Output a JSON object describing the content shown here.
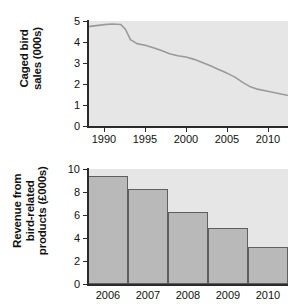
{
  "chart_data": [
    {
      "type": "line",
      "id": "caged-bird-sales",
      "title": "",
      "ylabel_lines": [
        "Caged bird",
        "sales (000s)"
      ],
      "xlabel": "",
      "xlim": [
        1988.0,
        2012.5
      ],
      "ylim": [
        0,
        5.2
      ],
      "yticks": [
        0,
        1,
        2,
        3,
        4,
        5
      ],
      "ytick_labels": [
        "0",
        "1",
        "2",
        "3",
        "4",
        "5"
      ],
      "xticks": [
        1990,
        1995,
        2000,
        2005,
        2010
      ],
      "xtick_labels": [
        "1990",
        "1995",
        "2000",
        "2005",
        "2010"
      ],
      "grid": false,
      "line_color": "#9a9a9a",
      "x": [
        1988.0,
        1989.0,
        1990.0,
        1991.0,
        1992.0,
        1992.6,
        1993.2,
        1994.0,
        1995.0,
        1996.0,
        1997.0,
        1998.0,
        1999.0,
        2000.0,
        2001.0,
        2002.0,
        2003.0,
        2004.0,
        2005.0,
        2006.0,
        2007.0,
        2007.8,
        2008.6,
        2010.0,
        2011.2,
        2012.4
      ],
      "y": [
        4.92,
        4.97,
        5.02,
        5.05,
        5.03,
        4.78,
        4.28,
        4.08,
        4.0,
        3.88,
        3.74,
        3.58,
        3.48,
        3.42,
        3.3,
        3.15,
        2.98,
        2.8,
        2.62,
        2.42,
        2.15,
        1.96,
        1.84,
        1.72,
        1.62,
        1.52
      ]
    },
    {
      "type": "bar",
      "id": "revenue-bird-products",
      "title": "",
      "ylabel_lines": [
        "Revenue from",
        "bird-related",
        "products (£000s)"
      ],
      "xlabel": "",
      "categories": [
        "2006",
        "2007",
        "2008",
        "2009",
        "2010"
      ],
      "values": [
        10.0,
        8.8,
        6.65,
        5.15,
        3.45
      ],
      "ylim": [
        0,
        10.6
      ],
      "yticks": [
        0,
        2,
        4,
        6,
        8,
        10
      ],
      "ytick_labels": [
        "0",
        "2",
        "4",
        "6",
        "8",
        "10"
      ],
      "grid": false,
      "bar_fill": "#b9b9b9",
      "bar_edge": "#5f5f5f"
    }
  ],
  "colors": {
    "panel_background": "#e6e6e6",
    "page_background": "#ffffff",
    "axis": "#2b2b2b",
    "text": "#111111",
    "line_series": "#9a9a9a",
    "bar_fill": "#b9b9b9",
    "bar_edge": "#5f5f5f"
  }
}
